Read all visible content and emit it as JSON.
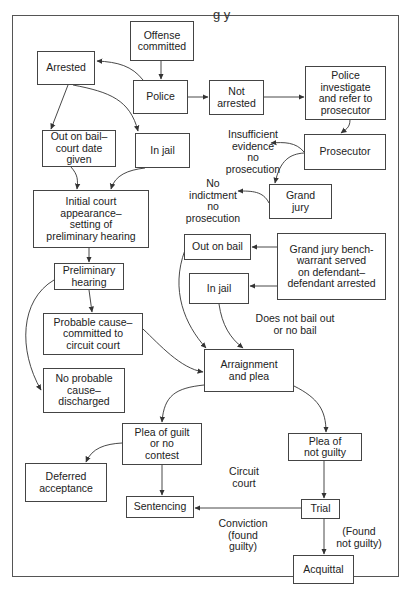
{
  "title_fragment": "g   y",
  "nodes": {
    "offense_committed": "Offense\ncommitted",
    "arrested": "Arrested",
    "police": "Police",
    "not_arrested": "Not\narrested",
    "police_investigate": "Police\ninvestigate\nand refer to\nprosecutor",
    "prosecutor": "Prosecutor",
    "grand_jury": "Grand\njury",
    "out_on_bail_court_date": "Out on bail–\ncourt date\ngiven",
    "in_jail_left": "In jail",
    "initial_court_appearance": "Initial court\nappearance–\nsetting of\npreliminary hearing",
    "preliminary_hearing": "Preliminary\nhearing",
    "probable_cause": "Probable cause–\ncommitted to\ncircuit court",
    "no_probable_cause": "No probable\ncause–\ndischarged",
    "out_on_bail_mid": "Out on bail",
    "in_jail_mid": "In jail",
    "bench_warrant": "Grand jury bench-\nwarrant served\non defendant–\ndefendant arrested",
    "arraignment": "Arraignment\nand plea",
    "plea_guilt": "Plea of guilt\nor no\ncontest",
    "deferred_acceptance": "Deferred\nacceptance",
    "sentencing": "Sentencing",
    "plea_not_guilty": "Plea of\nnot guilty",
    "trial": "Trial",
    "acquittal": "Acquittal"
  },
  "labels": {
    "insufficient_evidence": "Insufficient\nevidence\nno\nprosecution",
    "no_indictment": "No\nindictment\nno\nprosecution",
    "does_not_bail": "Does not bail out\nor no bail",
    "circuit_court": "Circuit\ncourt",
    "conviction": "Conviction\n(found\nguilty)",
    "found_not_guilty": "(Found\nnot guilty)"
  },
  "colors": {
    "line": "#333333",
    "border": "#444444",
    "frame": "#555555"
  }
}
